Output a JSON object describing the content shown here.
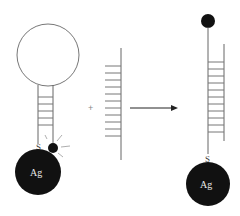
{
  "diagram": {
    "colors": {
      "line": "#777777",
      "fill_dark": "#111111",
      "background": "#ffffff"
    },
    "left_probe": {
      "loop_label": "",
      "sulfur_label": "S",
      "particle_label": "Ag",
      "quencher_state": "quenched (near particle, emitting rays)"
    },
    "operator": "+",
    "target_strand": {
      "rung_count": 11
    },
    "arrow": "reaction-arrow",
    "right_probe": {
      "sulfur_label": "S",
      "particle_label": "Ag",
      "duplex_rung_count": 11,
      "quencher_state": "separated (top of extended strand)"
    }
  }
}
